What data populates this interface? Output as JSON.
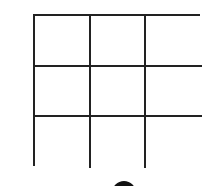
{
  "board": {
    "rows": 3,
    "cols": 3,
    "cells": [
      [
        "",
        "",
        ""
      ],
      [
        "",
        "",
        ""
      ],
      [
        "",
        "",
        ""
      ]
    ],
    "line_color": "#222222"
  },
  "turn_indicator": {
    "piece": "black-circle",
    "color": "#111111"
  }
}
